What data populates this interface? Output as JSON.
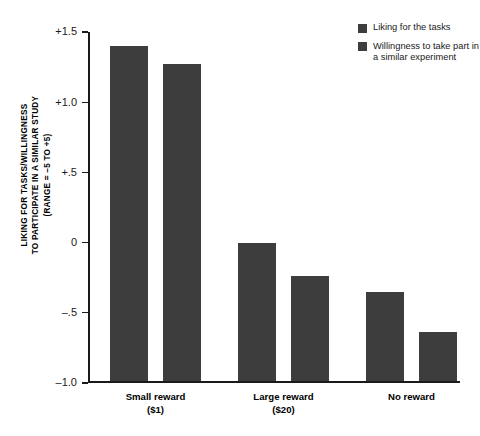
{
  "chart_data": {
    "type": "bar",
    "title": "",
    "xlabel": "",
    "ylabel": "LIKING FOR TASKS/WILLINGNESS TO PARTICIPATE IN A SIMILAR STUDY (RANGE = -5 TO +5)",
    "ylabel_lines": [
      "LIKING FOR TASKS/WILLINGNESS",
      "TO PARTICIPATE IN A SIMILAR STUDY",
      "(RANGE = –5 TO +5)"
    ],
    "categories": [
      "Small reward",
      "Large reward",
      "No reward"
    ],
    "category_sublabels": [
      "($1)",
      "($20)",
      ""
    ],
    "series": [
      {
        "name": "Liking for the tasks",
        "values": [
          1.4,
          0.0,
          -0.35
        ]
      },
      {
        "name": "Willingness to take part in a similar experiment",
        "values": [
          1.27,
          -0.24,
          -0.64
        ]
      }
    ],
    "ylim": [
      -1.0,
      1.5
    ],
    "yticks": [
      1.5,
      1.0,
      0.5,
      0.0,
      -0.5,
      -1.0
    ],
    "ytick_labels": [
      "+1.5",
      "+1.0",
      "+.5",
      "0",
      "–.5",
      "–1.0"
    ],
    "grid": false,
    "legend_position": "top-right",
    "bar_color": "#3d3d3d",
    "axis_color": "#1a1a1a"
  },
  "legend": {
    "items": [
      {
        "label": "Liking for the tasks",
        "color": "#3d3d3d"
      },
      {
        "label": "Willingness to take part in a similar experiment",
        "color": "#3d3d3d"
      }
    ]
  }
}
